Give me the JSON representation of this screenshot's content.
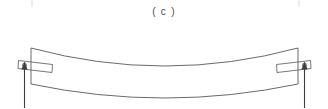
{
  "figure": {
    "caption": "( c )",
    "type": "engineering-line-diagram",
    "canvas": {
      "width": 328,
      "height": 108,
      "background": "#ffffff"
    },
    "colors": {
      "line": "#555555",
      "beam": "#4f4f4f",
      "plate": "#565656",
      "hole": "#4a4a4a",
      "arrow": "#3d3d3d",
      "crop_tick": "#d8d8d8",
      "caption_text": "#4a4a4a",
      "background": "#ffffff"
    },
    "crop_ticks": [
      {
        "name": "top-left-crop-tick",
        "x": 32,
        "y_top": 0,
        "y_bottom": 7
      },
      {
        "name": "top-right-crop-tick",
        "x": 299,
        "y_top": 0,
        "y_bottom": 7
      }
    ],
    "beam": {
      "name": "deflected-beam",
      "left_end_x": 31,
      "right_end_x": 298,
      "left_top_y": 48,
      "left_bottom_y": 84,
      "right_top_y": 48,
      "right_bottom_y": 84,
      "mid_top_y": 72,
      "mid_bottom_y": 98,
      "deflection_direction": "downward",
      "top_edge_path": "M 31 48 Q 164.5 84 298 48",
      "bottom_edge_path": "M 31 84 Q 164.5 112 298 84"
    },
    "supports": [
      {
        "name": "left-pin-support",
        "side": "left",
        "plate": {
          "points": "18.5,60.5 52.5,64.5 52,72.5 18,68.5",
          "tilt": "down-to-the-right"
        },
        "hole": {
          "cx": 24.5,
          "cy": 65.0,
          "r": 1.9
        },
        "reaction_arrow": {
          "name": "left-reaction-arrow",
          "shaft_x": 24.5,
          "shaft_top_y": 64,
          "shaft_bottom_y": 108,
          "direction": "up",
          "head_points": "24.5,61.5 21.4,69.5 27.6,69.5"
        }
      },
      {
        "name": "right-pin-support",
        "side": "right",
        "plate": {
          "points": "276.5,64.5 310.5,60.5 311,68.5 277,72.5",
          "tilt": "up-to-the-right"
        },
        "hole": {
          "cx": 304.5,
          "cy": 65.0,
          "r": 1.9
        },
        "reaction_arrow": {
          "name": "right-reaction-arrow",
          "shaft_x": 304.5,
          "shaft_top_y": 64,
          "shaft_bottom_y": 108,
          "direction": "up",
          "head_points": "304.5,61.5 301.4,69.5 307.6,69.5"
        }
      }
    ]
  }
}
